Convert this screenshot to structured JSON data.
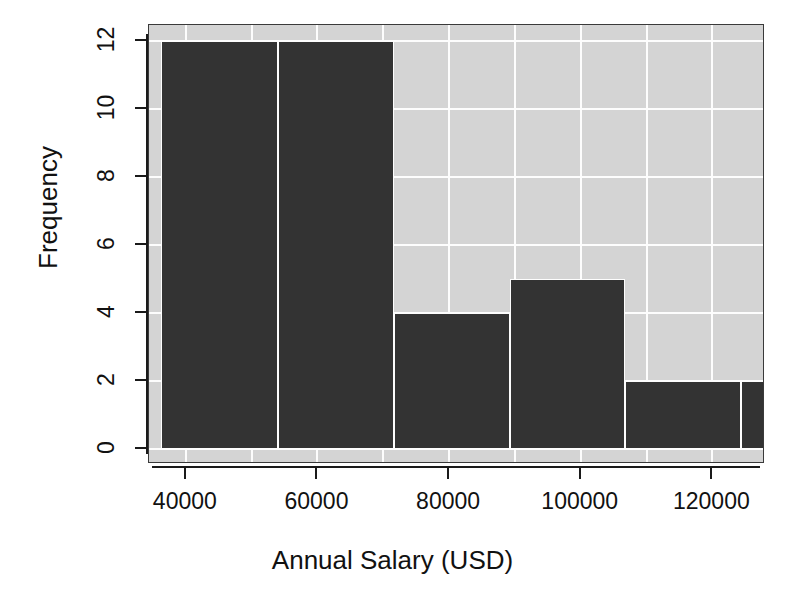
{
  "chart_data": {
    "type": "bar",
    "title": "",
    "subtitle": "",
    "xlabel": "Annual Salary (USD)",
    "ylabel": "Frequency",
    "xlim": [
      34400,
      128000
    ],
    "ylim": [
      0,
      12.4
    ],
    "grid": true,
    "legend": null,
    "style": {
      "panel_background": "#d4d4d4",
      "grid_color": "#fdfdfd",
      "bar_color": "#333333",
      "bar_border_color": "#fdfdfd",
      "axis_color": "#1a1a1a",
      "page_background": "#ffffff"
    },
    "bin_edges": [
      36200,
      54000,
      71600,
      89200,
      106800,
      124400,
      142000
    ],
    "bins": [
      {
        "label": "36200-54000",
        "x0": 36200,
        "x1": 54000,
        "value": 12
      },
      {
        "label": "54000-71600",
        "x0": 54000,
        "x1": 71600,
        "value": 12
      },
      {
        "label": "71600-89200",
        "x0": 71600,
        "x1": 89200,
        "value": 4
      },
      {
        "label": "89200-106800",
        "x0": 89200,
        "x1": 106800,
        "value": 5
      },
      {
        "label": "106800-124400",
        "x0": 106800,
        "x1": 124400,
        "value": 2
      },
      {
        "label": "124400-142000",
        "x0": 124400,
        "x1": 142000,
        "value": 2
      }
    ],
    "categories": [
      "36200-54000",
      "54000-71600",
      "71600-89200",
      "89200-106800",
      "106800-124400",
      "124400-142000"
    ],
    "values": [
      12,
      12,
      4,
      5,
      2,
      2
    ],
    "total_count": 37,
    "xticks": [
      {
        "value": 40000,
        "label": "40000"
      },
      {
        "value": 60000,
        "label": "60000"
      },
      {
        "value": 80000,
        "label": "80000"
      },
      {
        "value": 100000,
        "label": "100000"
      },
      {
        "value": 120000,
        "label": "120000"
      }
    ],
    "yticks": [
      {
        "value": 0,
        "label": "0"
      },
      {
        "value": 2,
        "label": "2"
      },
      {
        "value": 4,
        "label": "4"
      },
      {
        "value": 6,
        "label": "6"
      },
      {
        "value": 8,
        "label": "8"
      },
      {
        "value": 10,
        "label": "10"
      },
      {
        "value": 12,
        "label": "12"
      }
    ],
    "vertical_gridlines": [
      40000,
      50000,
      60000,
      70000,
      80000,
      90000,
      100000,
      110000,
      120000
    ],
    "horizontal_gridlines": [
      0,
      2,
      4,
      6,
      8,
      10,
      12
    ]
  }
}
